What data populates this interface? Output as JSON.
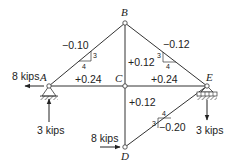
{
  "diagram": {
    "type": "truss",
    "nodes": [
      {
        "id": "A",
        "label": "A",
        "x": 49,
        "y": 86
      },
      {
        "id": "B",
        "label": "B",
        "x": 125,
        "y": 23
      },
      {
        "id": "C",
        "label": "C",
        "x": 125,
        "y": 86
      },
      {
        "id": "D",
        "label": "D",
        "x": 125,
        "y": 147
      },
      {
        "id": "E",
        "label": "E",
        "x": 207,
        "y": 86
      }
    ],
    "members": [
      {
        "from": "A",
        "to": "B",
        "force": "−0.10"
      },
      {
        "from": "B",
        "to": "E",
        "force": "−0.12"
      },
      {
        "from": "A",
        "to": "C",
        "force": "+0.24"
      },
      {
        "from": "C",
        "to": "E",
        "force": "+0.24"
      },
      {
        "from": "B",
        "to": "C",
        "force": "+0.12"
      },
      {
        "from": "C",
        "to": "D",
        "force": "+0.12"
      },
      {
        "from": "D",
        "to": "E",
        "force": "−0.20"
      }
    ],
    "slope_triangles": [
      {
        "member": "AB",
        "rise": "3",
        "run": "4"
      },
      {
        "member": "BE",
        "rise": "3",
        "run": "4"
      },
      {
        "member": "DE",
        "rise": "3",
        "run": "4"
      }
    ],
    "loads": [
      {
        "at": "A",
        "label": "8 kips",
        "direction": "left"
      },
      {
        "at": "A",
        "label": "3 kips",
        "direction": "up"
      },
      {
        "at": "D",
        "label": "8 kips",
        "direction": "right"
      },
      {
        "at": "E",
        "label": "3 kips",
        "direction": "down"
      }
    ],
    "supports": [
      {
        "at": "A",
        "type": "pin"
      },
      {
        "at": "E",
        "type": "roller"
      }
    ]
  },
  "labels": {
    "node_A": "A",
    "node_B": "B",
    "node_C": "C",
    "node_D": "D",
    "node_E": "E",
    "force_AB": "−0.10",
    "force_BE": "−0.12",
    "force_AC": "+0.24",
    "force_CE": "+0.24",
    "force_BC": "+0.12",
    "force_CD": "+0.12",
    "force_DE": "−0.20",
    "tri_AB_rise": "3",
    "tri_AB_run": "4",
    "tri_BE_rise": "3",
    "tri_BE_run": "4",
    "tri_DE_rise": "3",
    "tri_DE_run": "4",
    "load_A_horizontal": "8 kips",
    "load_A_vertical": "3 kips",
    "load_D_horizontal": "8 kips",
    "load_E_vertical": "3 kips"
  }
}
